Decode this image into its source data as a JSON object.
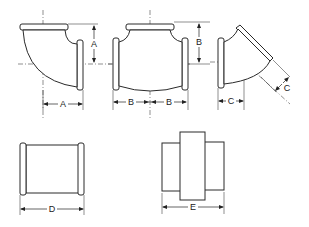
{
  "diagram": {
    "fittings": [
      {
        "name": "90° Elbow",
        "dimension_labels": [
          "A",
          "A"
        ]
      },
      {
        "name": "Tee",
        "dimension_labels": [
          "B",
          "B",
          "B"
        ]
      },
      {
        "name": "45° Elbow",
        "dimension_labels": [
          "C",
          "C"
        ]
      },
      {
        "name": "Coupling",
        "dimension_labels": [
          "D"
        ]
      },
      {
        "name": "Union",
        "dimension_labels": [
          "E"
        ]
      }
    ],
    "labels": {
      "elbow90_vertical": "A",
      "elbow90_horizontal": "A",
      "tee_vertical": "B",
      "tee_left": "B",
      "tee_right": "B",
      "elbow45_horizontal": "C",
      "elbow45_diagonal": "C",
      "coupling_length": "D",
      "union_length": "E"
    },
    "colors": {
      "line": "#2a2a2a",
      "background": "#ffffff"
    }
  }
}
